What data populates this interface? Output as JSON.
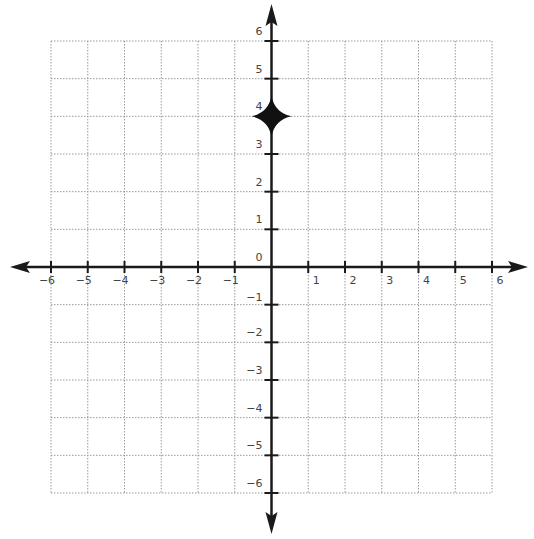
{
  "chart_data": {
    "type": "scatter",
    "title": "",
    "xlabel": "",
    "ylabel": "",
    "xlim": [
      -6,
      6
    ],
    "ylim": [
      -6,
      6
    ],
    "grid": true,
    "grid_style": "dotted",
    "x_ticks": [
      -6,
      -5,
      -4,
      -3,
      -2,
      -1,
      1,
      2,
      3,
      4,
      5,
      6
    ],
    "y_ticks": [
      -6,
      -5,
      -4,
      -3,
      -2,
      -1,
      0,
      1,
      2,
      3,
      4,
      5,
      6
    ],
    "x_tick_labels": [
      "−6",
      "−5",
      "−4",
      "−3",
      "−2",
      "−1",
      "1",
      "2",
      "3",
      "4",
      "5",
      "6"
    ],
    "y_tick_labels": [
      "−6",
      "−5",
      "−4",
      "−3",
      "−2",
      "−1",
      "0",
      "1",
      "2",
      "3",
      "4",
      "5",
      "6"
    ],
    "axes_arrows": true,
    "series": [
      {
        "name": "point",
        "points": [
          {
            "x": 0,
            "y": 4
          }
        ],
        "marker": "star4"
      }
    ],
    "legend": null
  },
  "colors": {
    "axis": "#1a1a1a",
    "grid": "#9a9a9a",
    "label": "#444444",
    "marker": "#111111"
  }
}
